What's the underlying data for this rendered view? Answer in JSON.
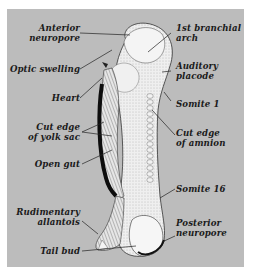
{
  "figure": {
    "background_color": "#bcbcbc"
  },
  "labels": {
    "anterior_neuropore": [
      "Anterior",
      "neuropore"
    ],
    "optic_swelling": [
      "Optic swelling"
    ],
    "heart": [
      "Heart"
    ],
    "cut_edge_yolk_sac": [
      "Cut edge",
      "of yolk sac"
    ],
    "open_gut": [
      "Open gut"
    ],
    "rudimentary_allantois": [
      "Rudimentary",
      "allantois"
    ],
    "tail_bud": [
      "Tail bud"
    ],
    "first_branchial_arch": [
      "1st branchial",
      "arch"
    ],
    "auditory_placode": [
      "Auditory",
      "placode"
    ],
    "somite_1": [
      "Somite 1"
    ],
    "cut_edge_amnion": [
      "Cut edge",
      "of amnion"
    ],
    "somite_16": [
      "Somite 16"
    ],
    "posterior_neuropore": [
      "Posterior",
      "neuropore"
    ]
  }
}
